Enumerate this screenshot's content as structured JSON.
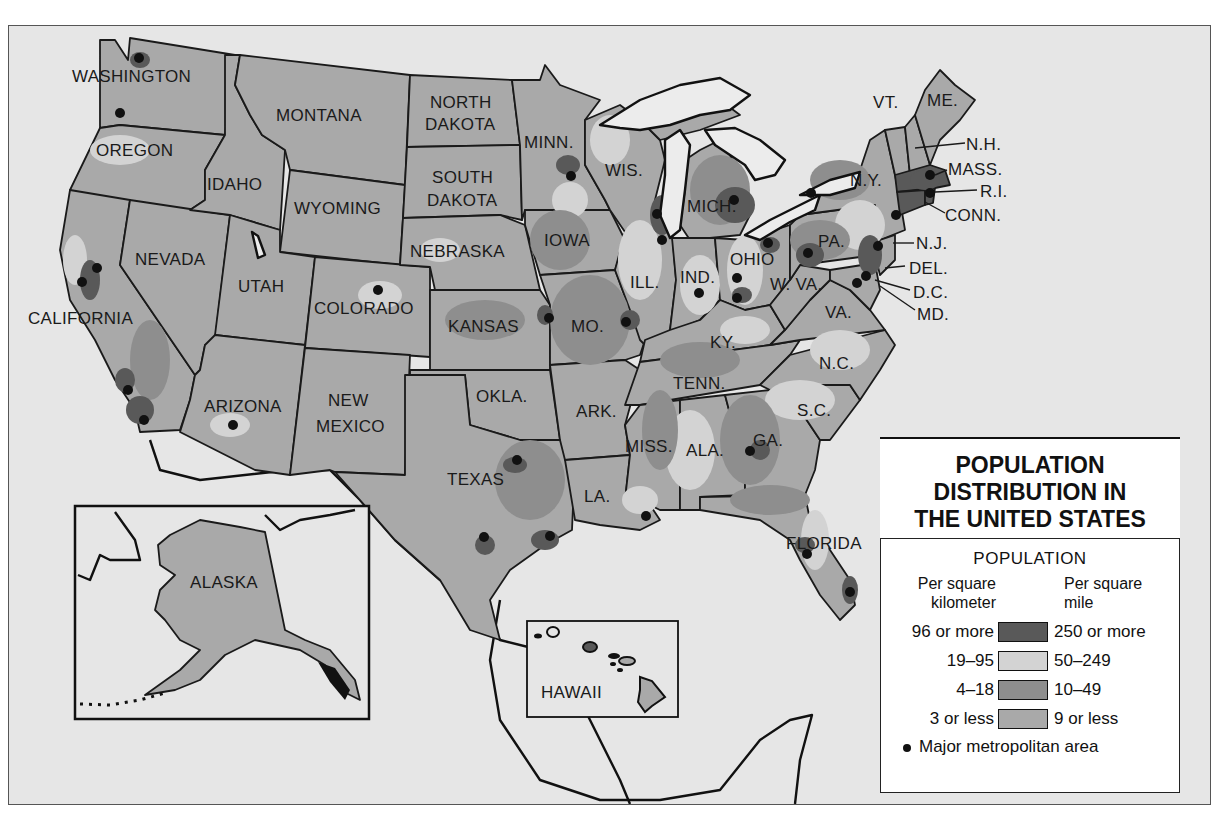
{
  "title": {
    "line1": "POPULATION",
    "line2": "DISTRIBUTION IN",
    "line3": "THE UNITED STATES"
  },
  "legend": {
    "heading": "POPULATION",
    "unit_left_line1": "Per square",
    "unit_left_line2": "kilometer",
    "unit_right_line1": "Per square",
    "unit_right_line2": "mile",
    "classes": [
      {
        "per_km2": "96 or more",
        "per_mi2": "250 or more",
        "color": "#595959"
      },
      {
        "per_km2": "19–95",
        "per_mi2": "50–249",
        "color": "#d3d3d3"
      },
      {
        "per_km2": "4–18",
        "per_mi2": "10–49",
        "color": "#8e8e8e"
      },
      {
        "per_km2": "3 or less",
        "per_mi2": "9 or less",
        "color": "#a9a9a9"
      }
    ],
    "metro_label": "Major metropolitan area"
  },
  "states": {
    "washington": "WASHINGTON",
    "oregon": "OREGON",
    "california": "CALIFORNIA",
    "idaho": "IDAHO",
    "nevada": "NEVADA",
    "montana": "MONTANA",
    "wyoming": "WYOMING",
    "utah": "UTAH",
    "colorado": "COLORADO",
    "arizona": "ARIZONA",
    "new_mexico_1": "NEW",
    "new_mexico_2": "MEXICO",
    "north_dakota_1": "NORTH",
    "north_dakota_2": "DAKOTA",
    "south_dakota_1": "SOUTH",
    "south_dakota_2": "DAKOTA",
    "nebraska": "NEBRASKA",
    "kansas": "KANSAS",
    "oklahoma": "OKLA.",
    "texas": "TEXAS",
    "minnesota": "MINN.",
    "iowa": "IOWA",
    "missouri": "MO.",
    "arkansas": "ARK.",
    "louisiana": "LA.",
    "wisconsin": "WIS.",
    "illinois": "ILL.",
    "michigan": "MICH.",
    "indiana": "IND.",
    "ohio": "OHIO",
    "kentucky": "KY.",
    "tennessee": "TENN.",
    "mississippi": "MISS.",
    "alabama": "ALA.",
    "georgia": "GA.",
    "florida": "FLORIDA",
    "south_carolina": "S.C.",
    "north_carolina": "N.C.",
    "virginia": "VA.",
    "west_virginia": "W. VA.",
    "pennsylvania": "PA.",
    "new_york": "N.Y.",
    "vermont": "VT.",
    "maine": "ME.",
    "new_hampshire": "N.H.",
    "massachusetts": "MASS.",
    "rhode_island": "R.I.",
    "connecticut": "CONN.",
    "new_jersey": "N.J.",
    "delaware": "DEL.",
    "dc": "D.C.",
    "maryland": "MD.",
    "alaska": "ALASKA",
    "hawaii": "HAWAII"
  },
  "colors": {
    "water": "#e6e6e6",
    "dense": "#595959",
    "moderate": "#d3d3d3",
    "sparse": "#8e8e8e",
    "very_sparse": "#a9a9a9",
    "border": "#1a1a1a"
  }
}
